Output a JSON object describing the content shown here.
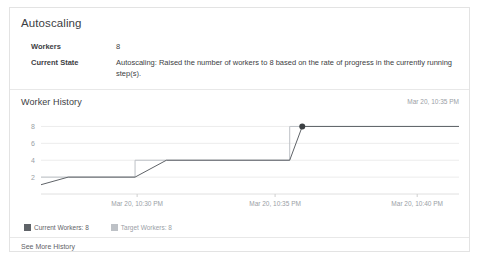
{
  "card": {
    "section_title": "Autoscaling",
    "details": [
      {
        "key": "Workers",
        "value": "8"
      },
      {
        "key": "Current State",
        "value": "Autoscaling: Raised the number of workers to 8 based on the rate of progress in the currently running step(s)."
      }
    ],
    "history": {
      "title": "Worker History",
      "updated_at": "Mar 20, 10:35 PM",
      "legend": [
        {
          "label": "Current Workers: 8",
          "color": "#5f6368"
        },
        {
          "label": "Target Workers: 8",
          "color": "#bdc1c6"
        }
      ],
      "see_more_label": "See More History"
    }
  },
  "chart_data": {
    "type": "line",
    "title": "Worker History",
    "xlabel": "",
    "ylabel": "",
    "grid": true,
    "legend_position": "bottom-left",
    "x_ticks": [
      "Mar 20, 10:30 PM",
      "Mar 20, 10:35 PM",
      "Mar 20, 10:40 PM"
    ],
    "x_tick_positions": [
      0.23,
      0.56,
      0.9
    ],
    "y_ticks": [
      2,
      4,
      6,
      8
    ],
    "ylim": [
      0,
      9
    ],
    "series": [
      {
        "name": "Current Workers: 8",
        "color": "#5f6368",
        "points": [
          {
            "x": 0.0,
            "y": 1.1
          },
          {
            "x": 0.065,
            "y": 2
          },
          {
            "x": 0.225,
            "y": 2
          },
          {
            "x": 0.3,
            "y": 4
          },
          {
            "x": 0.595,
            "y": 4
          },
          {
            "x": 0.625,
            "y": 8
          },
          {
            "x": 1.0,
            "y": 8
          }
        ],
        "marker": {
          "x": 0.625,
          "y": 8
        }
      },
      {
        "name": "Target Workers: 8",
        "color": "#bdc1c6",
        "points": [
          {
            "x": 0.0,
            "y": 2
          },
          {
            "x": 0.225,
            "y": 2
          },
          {
            "x": 0.225,
            "y": 4
          },
          {
            "x": 0.595,
            "y": 4
          },
          {
            "x": 0.595,
            "y": 8
          },
          {
            "x": 1.0,
            "y": 8
          }
        ]
      }
    ]
  }
}
